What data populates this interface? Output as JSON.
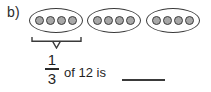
{
  "item": {
    "label": "b)",
    "background_color": "#ffffff",
    "ink_color": "#2b2b2b"
  },
  "groups": {
    "count": 3,
    "dots_per_group": 4,
    "total_dots": 12,
    "dot_fill_color": "#a8a8a8",
    "dot_outline_color": "#3c3c3c",
    "ellipse_outline_color": "#3a3a3a",
    "items": [
      {
        "name": "group-1",
        "dots": 4
      },
      {
        "name": "group-2",
        "dots": 4
      },
      {
        "name": "group-3",
        "dots": 4
      }
    ]
  },
  "brace": {
    "label": "",
    "spans_group_index": 0,
    "color": "#3a3a3a"
  },
  "question": {
    "fraction": {
      "numerator": "1",
      "denominator": "3"
    },
    "text": "of 12 is",
    "answer_value": "",
    "answer_blank_color": "#3a3a3a"
  }
}
